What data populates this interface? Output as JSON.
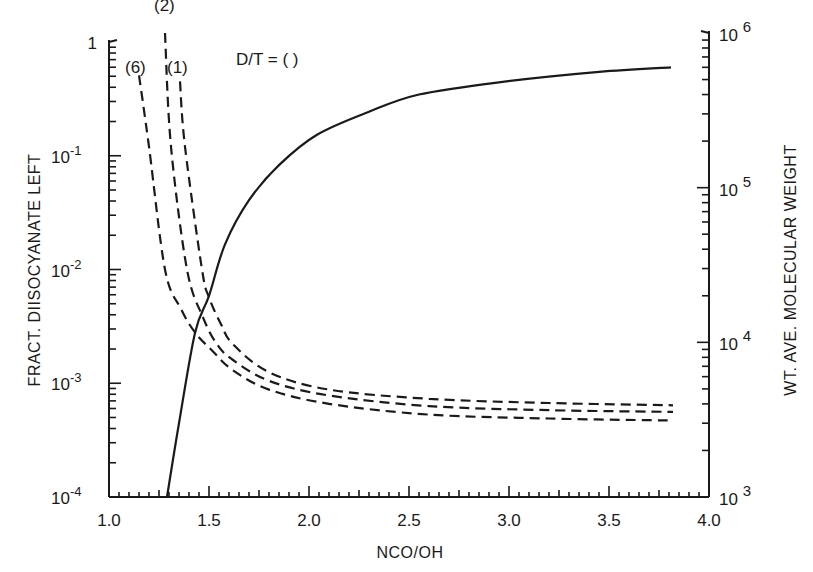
{
  "chart_data": {
    "type": "line",
    "title": "",
    "annotation": "D/T = ( )",
    "xlabel": "NCO/OH",
    "ylabel_left": "FRACT. DIISOCYANATE LEFT",
    "ylabel_right": "WT. AVE. MOLECULAR WEIGHT",
    "xlim": [
      1.0,
      4.0
    ],
    "ylim_left": [
      0.0001,
      1
    ],
    "ylim_right": [
      1000,
      1000000
    ],
    "yscale_left": "log",
    "yscale_right": "log",
    "grid": false,
    "x_ticks": [
      "1.0",
      "1.5",
      "2.0",
      "2.5",
      "3.0",
      "3.5",
      "4.0"
    ],
    "y_ticks_left": [
      {
        "value": 1,
        "label": "1",
        "exp": ""
      },
      {
        "value": 0.1,
        "label": "10",
        "exp": "-1"
      },
      {
        "value": 0.01,
        "label": "10",
        "exp": "-2"
      },
      {
        "value": 0.001,
        "label": "10",
        "exp": "-3"
      },
      {
        "value": 0.0001,
        "label": "10",
        "exp": "-4"
      }
    ],
    "y_ticks_right": [
      {
        "value": 1000000,
        "label": "10",
        "exp": "6"
      },
      {
        "value": 100000,
        "label": "10",
        "exp": "5"
      },
      {
        "value": 10000,
        "label": "10",
        "exp": "4"
      },
      {
        "value": 1000,
        "label": "10",
        "exp": "3"
      }
    ],
    "series": [
      {
        "name": "Wt. ave. molecular weight",
        "axis": "right",
        "style": "solid",
        "x": [
          1.29,
          1.35,
          1.43,
          1.5,
          1.58,
          1.7,
          1.85,
          2.04,
          2.3,
          2.55,
          2.95,
          3.45,
          3.81
        ],
        "values": [
          1000,
          3000,
          11500,
          20000,
          43000,
          83000,
          140000,
          220000,
          310000,
          400000,
          480000,
          560000,
          600000
        ]
      },
      {
        "name": "(6)",
        "axis": "left",
        "style": "dashed",
        "label_pos": [
          1.08,
          0.6
        ],
        "x": [
          1.15,
          1.2,
          1.28,
          1.36,
          1.43,
          1.52,
          1.62,
          1.8,
          2.1,
          2.6,
          3.2,
          3.82
        ],
        "values": [
          0.51,
          0.12,
          0.01,
          0.0045,
          0.0028,
          0.0019,
          0.0013,
          0.00088,
          0.00066,
          0.00053,
          0.00049,
          0.00047
        ]
      },
      {
        "name": "(2)",
        "axis": "left",
        "style": "dashed",
        "label_pos": [
          1.225,
          2.1
        ],
        "x": [
          1.28,
          1.31,
          1.39,
          1.47,
          1.54,
          1.62,
          1.8,
          2.1,
          2.6,
          3.2,
          3.82
        ],
        "values": [
          1.2,
          0.12,
          0.01,
          0.0038,
          0.0022,
          0.0016,
          0.00105,
          0.00078,
          0.00063,
          0.00058,
          0.00056
        ]
      },
      {
        "name": "(1)",
        "axis": "left",
        "style": "dashed",
        "label_pos": [
          1.29,
          0.6
        ],
        "x": [
          1.355,
          1.38,
          1.465,
          1.5,
          1.56,
          1.62,
          1.8,
          2.1,
          2.6,
          3.2,
          3.82
        ],
        "values": [
          0.45,
          0.12,
          0.01,
          0.0057,
          0.0033,
          0.0022,
          0.00125,
          0.00088,
          0.00073,
          0.00067,
          0.00064
        ]
      }
    ]
  }
}
